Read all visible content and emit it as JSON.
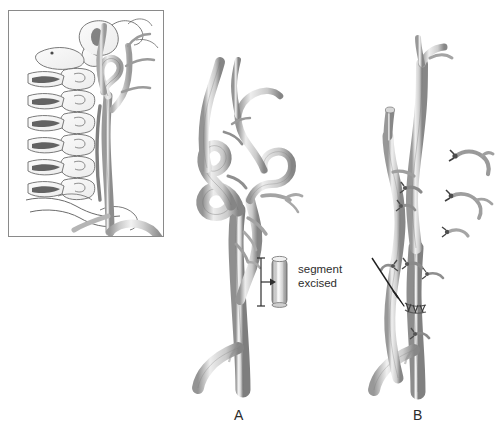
{
  "figure": {
    "caption_letters": {
      "panel_a": "A",
      "panel_b": "B"
    },
    "annotations": {
      "excised_line1": "segment",
      "excised_line2": "excised"
    }
  },
  "inset": {
    "name": "cervical-spine-inset",
    "description": "lateral cervical spine with tortuous carotid artery",
    "border_color": "#8a8a8a",
    "background": "#ffffff"
  },
  "panel_a": {
    "name": "tortuous-carotid-preoperative",
    "features": [
      "redundant-loop",
      "kinked-segment",
      "branch-vessels",
      "carotid-bifurcation",
      "excised-segment-specimen",
      "measurement-bracket"
    ]
  },
  "panel_b": {
    "name": "straightened-carotid-postoperative",
    "features": [
      "straightened-vessel",
      "ligated-branch-stumps",
      "detached-branch-stumps",
      "suture-anastomosis-line",
      "pointer-arrow",
      "carotid-bifurcation"
    ]
  },
  "colors": {
    "vessel_light": "#e8e8e8",
    "vessel_mid": "#b4b4b4",
    "vessel_dark": "#6f6f6f",
    "outline": "#5a5a5a",
    "bone_outline": "#6b6b6b",
    "text": "#2b2b2b",
    "background": "#ffffff"
  }
}
